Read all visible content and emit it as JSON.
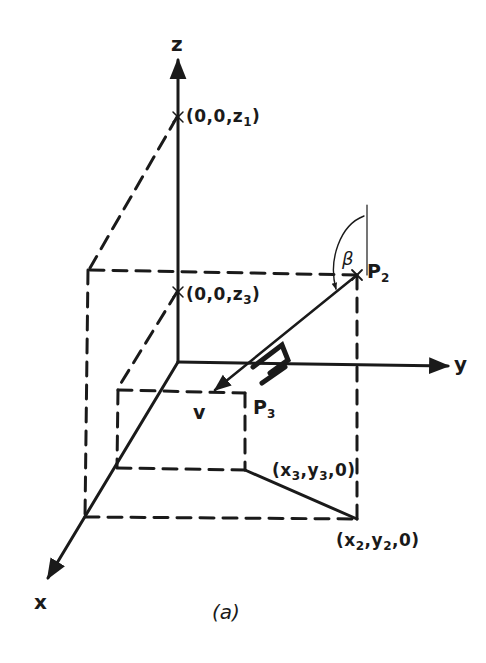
{
  "figure": {
    "caption": "(a)",
    "axes": {
      "x_label": "x",
      "y_label": "y",
      "z_label": "z"
    },
    "points": {
      "z1": {
        "open": "(0,0,",
        "var": "z",
        "sub": "1",
        "close": ")"
      },
      "z3": {
        "open": "(0,0,",
        "var": "z",
        "sub": "3",
        "close": ")"
      },
      "P2": {
        "name": "P",
        "sub": "2"
      },
      "P3": {
        "name": "P",
        "sub": "3"
      },
      "xy3": {
        "open": "(",
        "x": "x",
        "xsub": "3",
        "sep1": ",",
        "y": "y",
        "ysub": "3",
        "close": ",0)"
      },
      "xy2": {
        "open": "(",
        "x": "x",
        "xsub": "2",
        "sep1": ",",
        "y": "y",
        "ysub": "2",
        "close": ",0)"
      }
    },
    "angle_label": "β",
    "velocity_label": "v",
    "colors": {
      "ink": "#1a1a1a",
      "background": "#ffffff"
    }
  }
}
